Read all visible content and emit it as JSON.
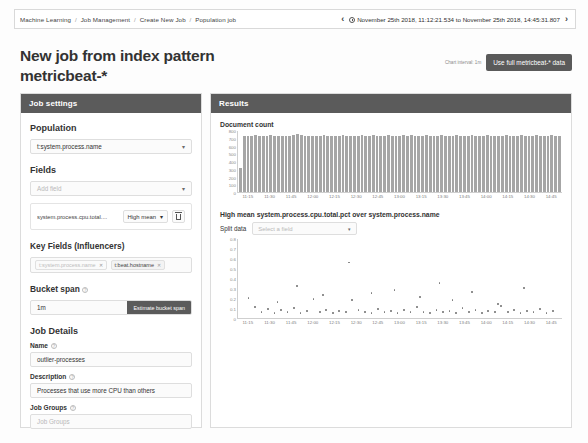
{
  "topbar": {
    "breadcrumb": [
      "Machine Learning",
      "Job Management",
      "Create New Job",
      "Population job"
    ],
    "prev_icon": "chevron-left-icon",
    "next_icon": "chevron-right-icon",
    "clock_icon": "clock-icon",
    "date_range": "November 25th 2018, 11:12:21.534 to November 25th 2018, 14:45:31.807"
  },
  "header": {
    "title": "New job from index pattern metricbeat-*",
    "chart_interval": "Chart interval: 1m",
    "full_data_button": "Use full metricbeat-* data"
  },
  "job_settings": {
    "panel_title": "Job settings",
    "population": {
      "label": "Population",
      "value": "t:system.process.name",
      "caret_icon": "chevron-down-icon"
    },
    "fields": {
      "label": "Fields",
      "add_field_placeholder": "Add field",
      "caret_icon": "chevron-down-icon",
      "detectors": [
        {
          "field": "system.process.cpu.total....",
          "function": "High mean",
          "caret_icon": "chevron-down-icon",
          "delete_icon": "trash-icon"
        }
      ]
    },
    "influencers": {
      "label": "Key Fields (Influencers)",
      "tags": [
        {
          "text": "t:system.process.name",
          "muted": true,
          "remove_icon": "close-icon"
        },
        {
          "text": "t:beat.hostname",
          "muted": false,
          "remove_icon": "close-icon"
        }
      ]
    },
    "bucket_span": {
      "label": "Bucket span",
      "help_icon": "question-icon",
      "value": "1m",
      "estimate_button": "Estimate bucket span"
    },
    "job_details": {
      "label": "Job Details",
      "name": {
        "label": "Name",
        "help_icon": "question-icon",
        "value": "outlier-processes"
      },
      "description": {
        "label": "Description",
        "help_icon": "question-icon",
        "value": "Processes that use more CPU than others"
      },
      "job_groups": {
        "label": "Job Groups",
        "help_icon": "question-icon",
        "placeholder": "Job Groups"
      }
    }
  },
  "results": {
    "panel_title": "Results",
    "document_count_label": "Document count",
    "scatter_title": "High mean system.process.cpu.total.pct over system.process.name",
    "split_data": {
      "label": "Split data",
      "placeholder": "Select a field",
      "caret_icon": "chevron-down-icon"
    }
  },
  "chart_data": [
    {
      "type": "bar",
      "title": "Document count",
      "xlabel": "",
      "ylabel": "",
      "ylim": [
        0,
        800
      ],
      "yticks": [
        0,
        100,
        200,
        300,
        400,
        500,
        600,
        700,
        800
      ],
      "grid": false,
      "xticks": [
        "11:15",
        "11:30",
        "11:45",
        "12:00",
        "12:15",
        "12:30",
        "12:45",
        "13:00",
        "13:15",
        "13:30",
        "13:45",
        "14:00",
        "14:15",
        "14:30",
        "14:45"
      ],
      "values": [
        310,
        735,
        740,
        738,
        742,
        735,
        730,
        738,
        742,
        736,
        733,
        740,
        738,
        735,
        742,
        760,
        742,
        735,
        738,
        740,
        733,
        736,
        742,
        738,
        735,
        740,
        738,
        742,
        735,
        733,
        738,
        740,
        745,
        736,
        738,
        742,
        735,
        740,
        738,
        742,
        736,
        735,
        738,
        745,
        740,
        742,
        735,
        738,
        740,
        742,
        736,
        738,
        735,
        742,
        740,
        738,
        736,
        742,
        735,
        738,
        740,
        742,
        736,
        735,
        738,
        742,
        740,
        736,
        738,
        735,
        742,
        740,
        738,
        736,
        742,
        738,
        735,
        740,
        742,
        736,
        738,
        740,
        742,
        735,
        738
      ]
    },
    {
      "type": "scatter",
      "title": "High mean system.process.cpu.total.pct over system.process.name",
      "xlabel": "",
      "ylabel": "",
      "ylim": [
        0,
        0.8
      ],
      "yticks": [
        0,
        0.1,
        0.2,
        0.3,
        0.4,
        0.5,
        0.6,
        0.7,
        0.8
      ],
      "grid": false,
      "xticks": [
        "11:15",
        "11:30",
        "11:45",
        "12:00",
        "12:15",
        "12:30",
        "12:45",
        "13:00",
        "13:15",
        "13:30",
        "13:45",
        "14:00",
        "14:15",
        "14:30",
        "14:45"
      ],
      "points": [
        {
          "x": 0.03,
          "y": 0.21
        },
        {
          "x": 0.05,
          "y": 0.12
        },
        {
          "x": 0.07,
          "y": 0.07
        },
        {
          "x": 0.09,
          "y": 0.1
        },
        {
          "x": 0.11,
          "y": 0.06
        },
        {
          "x": 0.13,
          "y": 0.09
        },
        {
          "x": 0.15,
          "y": 0.07
        },
        {
          "x": 0.17,
          "y": 0.11
        },
        {
          "x": 0.19,
          "y": 0.06
        },
        {
          "x": 0.21,
          "y": 0.08
        },
        {
          "x": 0.23,
          "y": 0.2
        },
        {
          "x": 0.25,
          "y": 0.07
        },
        {
          "x": 0.27,
          "y": 0.09
        },
        {
          "x": 0.29,
          "y": 0.06
        },
        {
          "x": 0.31,
          "y": 0.08
        },
        {
          "x": 0.33,
          "y": 0.07
        },
        {
          "x": 0.35,
          "y": 0.19
        },
        {
          "x": 0.37,
          "y": 0.09
        },
        {
          "x": 0.39,
          "y": 0.07
        },
        {
          "x": 0.41,
          "y": 0.06
        },
        {
          "x": 0.43,
          "y": 0.1
        },
        {
          "x": 0.45,
          "y": 0.07
        },
        {
          "x": 0.47,
          "y": 0.08
        },
        {
          "x": 0.49,
          "y": 0.06
        },
        {
          "x": 0.51,
          "y": 0.09
        },
        {
          "x": 0.53,
          "y": 0.07
        },
        {
          "x": 0.55,
          "y": 0.12
        },
        {
          "x": 0.57,
          "y": 0.07
        },
        {
          "x": 0.59,
          "y": 0.06
        },
        {
          "x": 0.61,
          "y": 0.09
        },
        {
          "x": 0.63,
          "y": 0.07
        },
        {
          "x": 0.65,
          "y": 0.08
        },
        {
          "x": 0.67,
          "y": 0.06
        },
        {
          "x": 0.69,
          "y": 0.11
        },
        {
          "x": 0.71,
          "y": 0.07
        },
        {
          "x": 0.73,
          "y": 0.09
        },
        {
          "x": 0.75,
          "y": 0.06
        },
        {
          "x": 0.77,
          "y": 0.08
        },
        {
          "x": 0.79,
          "y": 0.07
        },
        {
          "x": 0.81,
          "y": 0.13
        },
        {
          "x": 0.83,
          "y": 0.07
        },
        {
          "x": 0.85,
          "y": 0.09
        },
        {
          "x": 0.87,
          "y": 0.06
        },
        {
          "x": 0.89,
          "y": 0.08
        },
        {
          "x": 0.91,
          "y": 0.07
        },
        {
          "x": 0.93,
          "y": 0.1
        },
        {
          "x": 0.95,
          "y": 0.06
        },
        {
          "x": 0.97,
          "y": 0.08
        },
        {
          "x": 0.34,
          "y": 0.57
        },
        {
          "x": 0.62,
          "y": 0.36
        },
        {
          "x": 0.48,
          "y": 0.29
        },
        {
          "x": 0.18,
          "y": 0.33
        },
        {
          "x": 0.72,
          "y": 0.27
        },
        {
          "x": 0.88,
          "y": 0.31
        },
        {
          "x": 0.26,
          "y": 0.24
        },
        {
          "x": 0.56,
          "y": 0.22
        },
        {
          "x": 0.41,
          "y": 0.26
        },
        {
          "x": 0.66,
          "y": 0.19
        },
        {
          "x": 0.12,
          "y": 0.17
        },
        {
          "x": 0.8,
          "y": 0.15
        }
      ]
    }
  ]
}
